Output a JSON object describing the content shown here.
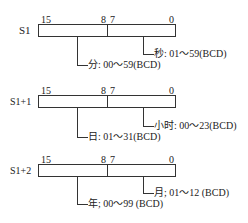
{
  "registers": [
    {
      "name": "S1",
      "bits": {
        "b15": "15",
        "b8": "8",
        "b7": "7",
        "b0": "0"
      },
      "low_field": "秒: 01～59(BCD)",
      "high_field": "分: 00～59(BCD)"
    },
    {
      "name": "S1+1",
      "bits": {
        "b15": "15",
        "b8": "8",
        "b7": "7",
        "b0": "0"
      },
      "low_field": "小时: 00～23(BCD)",
      "high_field": "日: 01～31(BCD)"
    },
    {
      "name": "S1+2",
      "bits": {
        "b15": "15",
        "b8": "8",
        "b7": "7",
        "b0": "0"
      },
      "low_field": "月; 01～12 (BCD)",
      "high_field": "年; 00～99 (BCD)"
    }
  ]
}
